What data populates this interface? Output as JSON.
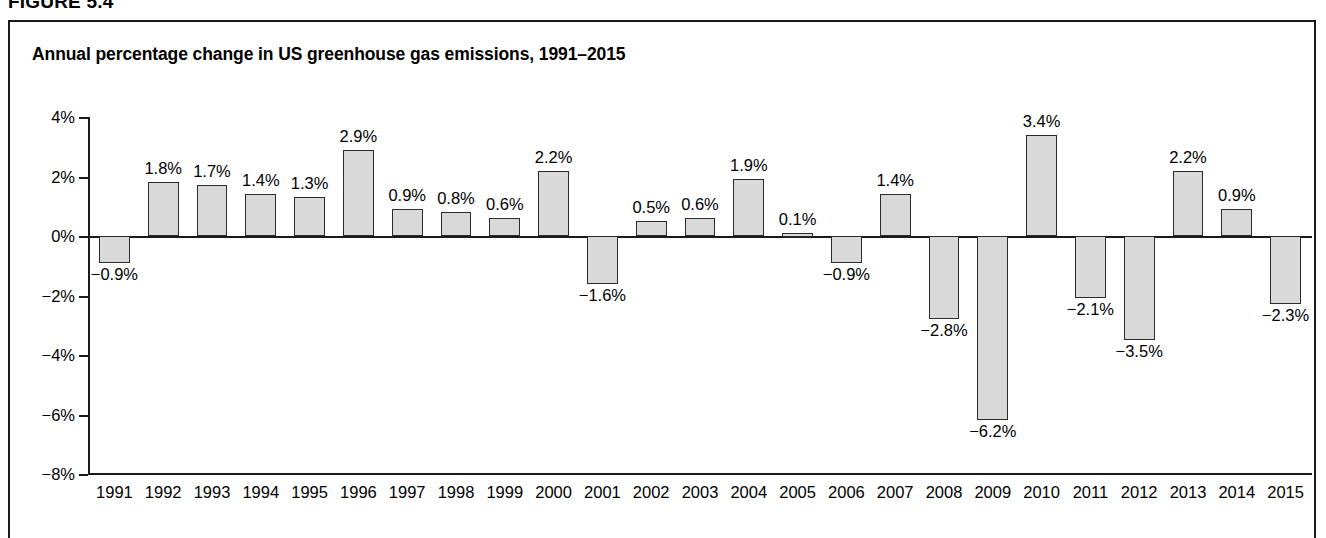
{
  "figure": {
    "label": "FIGURE 5.4"
  },
  "chart_data": {
    "type": "bar",
    "title": "Annual percentage change in US greenhouse gas emissions, 1991–2015",
    "xlabel": "",
    "ylabel": "",
    "ylim": [
      -8,
      4
    ],
    "yticks": [
      4,
      2,
      0,
      -2,
      -4,
      -6,
      -8
    ],
    "ytick_labels": [
      "4%",
      "2%",
      "0%",
      "−2%",
      "−4%",
      "−6%",
      "−8%"
    ],
    "grid": false,
    "legend": null,
    "categories": [
      "1991",
      "1992",
      "1993",
      "1994",
      "1995",
      "1996",
      "1997",
      "1998",
      "1999",
      "2000",
      "2001",
      "2002",
      "2003",
      "2004",
      "2005",
      "2006",
      "2007",
      "2008",
      "2009",
      "2010",
      "2011",
      "2012",
      "2013",
      "2014",
      "2015"
    ],
    "values": [
      -0.9,
      1.8,
      1.7,
      1.4,
      1.3,
      2.9,
      0.9,
      0.8,
      0.6,
      2.2,
      -1.6,
      0.5,
      0.6,
      1.9,
      0.1,
      -0.9,
      1.4,
      -2.8,
      -6.2,
      3.4,
      -2.1,
      -3.5,
      2.2,
      0.9,
      -2.3
    ],
    "data_labels": [
      "−0.9%",
      "1.8%",
      "1.7%",
      "1.4%",
      "1.3%",
      "2.9%",
      "0.9%",
      "0.8%",
      "0.6%",
      "2.2%",
      "−1.6%",
      "0.5%",
      "0.6%",
      "1.9%",
      "0.1%",
      "−0.9%",
      "1.4%",
      "−2.8%",
      "−6.2%",
      "3.4%",
      "−2.1%",
      "−3.5%",
      "2.2%",
      "0.9%",
      "−2.3%"
    ],
    "bar_fill_color": "#d9d9d9",
    "bar_edge_color": "#2b2b2b",
    "axis_color": "#1a1a1a",
    "background_color": "#ffffff"
  }
}
